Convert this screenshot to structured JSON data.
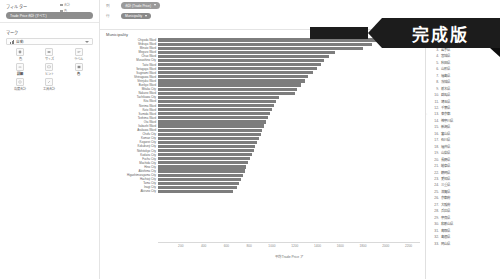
{
  "left_pane": {
    "filters_title": "フィルター",
    "filter_pills": [
      {
        "label": "Trade Price 合計 (すべて)"
      }
    ],
    "marks_title": "マーク",
    "mark_select": {
      "label": "自動",
      "icon": "bar-chart-icon"
    },
    "mark_buttons": [
      {
        "label": "色",
        "icon": "color-icon",
        "strong": false
      },
      {
        "label": "サイズ",
        "icon": "size-icon",
        "strong": false
      },
      {
        "label": "ラベル",
        "icon": "label-icon",
        "strong": false
      },
      {
        "label": "詳細",
        "icon": "detail-icon",
        "strong": true
      },
      {
        "label": "ヒント",
        "icon": "tooltip-icon",
        "strong": false
      },
      {
        "label": "色",
        "icon": "palette-icon",
        "strong": true
      },
      {
        "label": "角度合計",
        "icon": "angle-icon",
        "strong": false
      },
      {
        "label": "工具合計",
        "icon": "tool-icon",
        "strong": false
      }
    ]
  },
  "topbar": {
    "columns_label": "列",
    "rows_label": "行",
    "column_pill": "合計 (Trade Price)",
    "row_pill": "Municipality",
    "legend": [
      {
        "label": "合計"
      },
      {
        "label": "色"
      }
    ]
  },
  "chart_data": {
    "type": "bar",
    "title": "Municipality",
    "xlabel": "平均 Trade Price ア",
    "ylabel": "",
    "xlim": [
      0,
      2300
    ],
    "grid": false,
    "orientation": "horizontal",
    "ticks": [
      200,
      400,
      600,
      800,
      1000,
      1200,
      1400,
      1600,
      1800,
      2000,
      2200
    ],
    "categories": [
      "Chiyoda Ward",
      "Shibuya Ward",
      "Minato Ward",
      "Meguro Ward",
      "Chuo Ward",
      "Musashino City",
      "Taito Ward",
      "Setagaya Ward",
      "Suginami Ward",
      "Shinagawa Ward",
      "Shinjuku Ward",
      "Bunkyo Ward",
      "Mitaka City",
      "Nakano Ward",
      "Tachikawa City",
      "Kita Ward",
      "Nerima Ward",
      "Koto Ward",
      "Sumida Ward",
      "Toshima Ward",
      "Ota Ward",
      "Itabashi Ward",
      "Arakawa Ward",
      "Chofu City",
      "Komae City",
      "Koganei City",
      "Kokubunji City",
      "Nishitokyo City",
      "Kodaira City",
      "Fuchu City",
      "Machida City",
      "Hino City",
      "Akishima City",
      "Higashimurayama City",
      "Hachioji City",
      "Tama City",
      "Inagi City",
      "Akiruno City"
    ],
    "values": [
      2270,
      1880,
      1800,
      1550,
      1500,
      1455,
      1430,
      1400,
      1360,
      1320,
      1290,
      1255,
      1220,
      1200,
      1060,
      1040,
      1020,
      1000,
      985,
      965,
      950,
      930,
      915,
      900,
      885,
      870,
      855,
      840,
      825,
      810,
      790,
      775,
      760,
      745,
      730,
      712,
      690,
      660
    ]
  },
  "right_list": {
    "items": [
      {
        "num": "1.",
        "label": "北海道",
        "marked": false
      },
      {
        "num": "2.",
        "label": "青森県",
        "marked": false
      },
      {
        "num": "3.",
        "label": "岩手県",
        "marked": false
      },
      {
        "num": "4.",
        "label": "宮城県",
        "marked": false
      },
      {
        "num": "5.",
        "label": "秋田県",
        "marked": false
      },
      {
        "num": "6.",
        "label": "山形県",
        "marked": false
      },
      {
        "num": "7.",
        "label": "福島県",
        "marked": false
      },
      {
        "num": "8.",
        "label": "茨城県",
        "marked": false
      },
      {
        "num": "9.",
        "label": "栃木県",
        "marked": false
      },
      {
        "num": "10.",
        "label": "群馬県",
        "marked": false
      },
      {
        "num": "11.",
        "label": "埼玉県",
        "marked": false
      },
      {
        "num": "12.",
        "label": "千葉県",
        "marked": false
      },
      {
        "num": "13.",
        "label": "東京都",
        "marked": true
      },
      {
        "num": "14.",
        "label": "神奈川県",
        "marked": false
      },
      {
        "num": "15.",
        "label": "新潟県",
        "marked": false
      },
      {
        "num": "16.",
        "label": "富山県",
        "marked": false
      },
      {
        "num": "17.",
        "label": "石川県",
        "marked": false
      },
      {
        "num": "18.",
        "label": "福井県",
        "marked": false
      },
      {
        "num": "19.",
        "label": "山梨県",
        "marked": false
      },
      {
        "num": "20.",
        "label": "長野県",
        "marked": false
      },
      {
        "num": "21.",
        "label": "岐阜県",
        "marked": false
      },
      {
        "num": "22.",
        "label": "静岡県",
        "marked": false
      },
      {
        "num": "23.",
        "label": "愛知県",
        "marked": false
      },
      {
        "num": "24.",
        "label": "三重県",
        "marked": false
      },
      {
        "num": "25.",
        "label": "滋賀県",
        "marked": false
      },
      {
        "num": "26.",
        "label": "京都府",
        "marked": false
      },
      {
        "num": "27.",
        "label": "大阪府",
        "marked": false
      },
      {
        "num": "28.",
        "label": "兵庫県",
        "marked": false
      },
      {
        "num": "29.",
        "label": "奈良県",
        "marked": false
      },
      {
        "num": "30.",
        "label": "和歌山県",
        "marked": false
      },
      {
        "num": "31.",
        "label": "鳥取県",
        "marked": false
      },
      {
        "num": "32.",
        "label": "島根県",
        "marked": false
      },
      {
        "num": "33.",
        "label": "岡山県",
        "marked": false
      }
    ]
  },
  "banner": {
    "text": "完成版"
  }
}
